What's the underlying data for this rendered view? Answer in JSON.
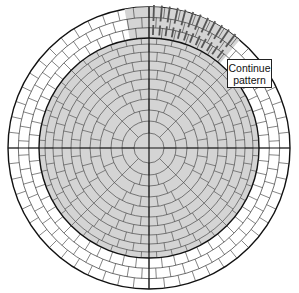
{
  "diagram": {
    "callout": {
      "line1": "Continue",
      "line2": "pattern"
    },
    "inner_field": {
      "fill": "#d4d4d4",
      "rings": 10
    },
    "outer_band": {
      "fill": "#ffffff",
      "courses": 3,
      "pattern_wedge_fill": "#d4d4d4",
      "pattern_wedge_start_deg": -10,
      "pattern_wedge_end_deg": 40
    },
    "colors": {
      "line": "#333333",
      "heavy_line": "#111111",
      "pattern_mark": "#555555"
    }
  }
}
